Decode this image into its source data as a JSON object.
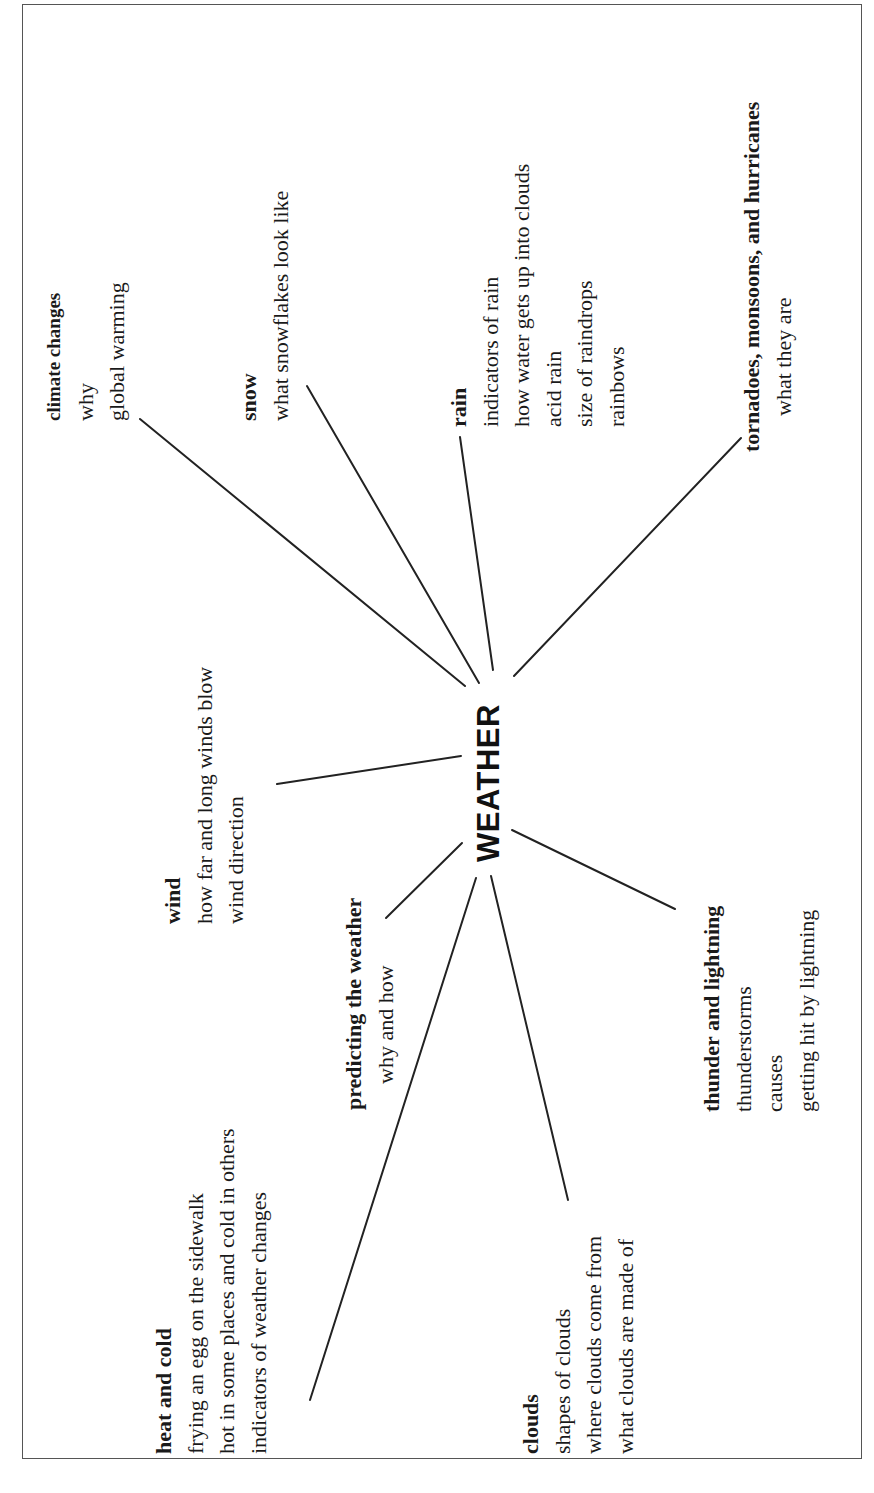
{
  "center": {
    "label": "WEATHER"
  },
  "branches": [
    {
      "id": "climate",
      "title": "climate changes",
      "items": [
        "why",
        "global warming"
      ]
    },
    {
      "id": "snow",
      "title": "snow",
      "items": [
        "what snowflakes look like"
      ]
    },
    {
      "id": "rain",
      "title": "rain",
      "items": [
        "indicators of rain",
        "how water gets up into clouds",
        "acid rain",
        "size of raindrops",
        "rainbows"
      ]
    },
    {
      "id": "tornadoes",
      "title": "tornadoes, monsoons, and hurricanes",
      "items": [
        "what they are"
      ]
    },
    {
      "id": "wind",
      "title": "wind",
      "items": [
        "how far and long winds blow",
        "wind direction"
      ]
    },
    {
      "id": "predicting",
      "title": "predicting the weather",
      "items": [
        "why and how"
      ]
    },
    {
      "id": "heat",
      "title": "heat and cold",
      "items": [
        "frying an egg on the sidewalk",
        "hot in some places and cold in others",
        "indicators of weather changes"
      ]
    },
    {
      "id": "clouds",
      "title": "clouds",
      "items": [
        "shapes of clouds",
        "where clouds come from",
        "what clouds are made of"
      ]
    },
    {
      "id": "thunder",
      "title": "thunder and lightning",
      "items": [
        "thunderstorms",
        "causes",
        "getting hit by lightning"
      ]
    }
  ],
  "colors": {
    "ink": "#1a1a1a",
    "line": "#222222",
    "border": "#555555",
    "background": "#ffffff"
  }
}
